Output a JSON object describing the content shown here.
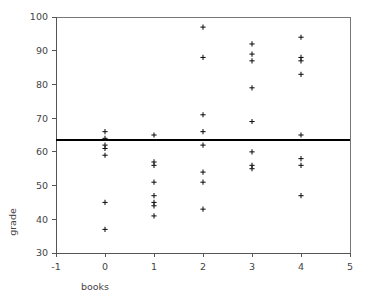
{
  "chart_data": {
    "type": "scatter",
    "title": "",
    "xlabel": "books",
    "ylabel": "grade",
    "xlim": [
      -1,
      5
    ],
    "ylim": [
      30,
      100
    ],
    "xticks": [
      -1,
      0,
      1,
      2,
      3,
      4,
      5
    ],
    "xtick_labels": [
      "-1",
      "0",
      "1",
      "2",
      "3",
      "4",
      "5"
    ],
    "yticks": [
      30,
      40,
      50,
      60,
      70,
      80,
      90,
      100
    ],
    "ytick_labels": [
      "30",
      "40",
      "50",
      "60",
      "70",
      "80",
      "90",
      "100"
    ],
    "grid": false,
    "legend": null,
    "marker": "plus",
    "marker_color": "#111111",
    "reference_line": {
      "orientation": "horizontal",
      "value": 63.5,
      "color": "#000000",
      "label": ""
    },
    "x": [
      0,
      0,
      0,
      0,
      0,
      0,
      0,
      1,
      1,
      1,
      1,
      1,
      1,
      1,
      2,
      2,
      2,
      2,
      2,
      2,
      2,
      2,
      2,
      3,
      3,
      3,
      3,
      3,
      3,
      3,
      3,
      3,
      4,
      4,
      4,
      4,
      4,
      4,
      4,
      4
    ],
    "y": [
      66,
      64,
      62,
      61,
      59,
      45,
      37,
      65,
      57,
      56,
      51,
      47,
      45,
      44,
      41,
      97,
      88,
      71,
      66,
      62,
      54,
      51,
      43,
      92,
      89,
      87,
      79,
      69,
      60,
      56,
      55,
      94,
      88,
      87,
      83,
      65,
      58,
      56,
      47
    ],
    "points": [
      {
        "x": 0,
        "y": 66
      },
      {
        "x": 0,
        "y": 64
      },
      {
        "x": 0,
        "y": 62
      },
      {
        "x": 0,
        "y": 61
      },
      {
        "x": 0,
        "y": 59
      },
      {
        "x": 0,
        "y": 45
      },
      {
        "x": 0,
        "y": 37
      },
      {
        "x": 1,
        "y": 65
      },
      {
        "x": 1,
        "y": 57
      },
      {
        "x": 1,
        "y": 56
      },
      {
        "x": 1,
        "y": 51
      },
      {
        "x": 1,
        "y": 47
      },
      {
        "x": 1,
        "y": 45
      },
      {
        "x": 1,
        "y": 44
      },
      {
        "x": 1,
        "y": 41
      },
      {
        "x": 2,
        "y": 97
      },
      {
        "x": 2,
        "y": 88
      },
      {
        "x": 2,
        "y": 71
      },
      {
        "x": 2,
        "y": 66
      },
      {
        "x": 2,
        "y": 62
      },
      {
        "x": 2,
        "y": 54
      },
      {
        "x": 2,
        "y": 51
      },
      {
        "x": 2,
        "y": 43
      },
      {
        "x": 3,
        "y": 92
      },
      {
        "x": 3,
        "y": 89
      },
      {
        "x": 3,
        "y": 87
      },
      {
        "x": 3,
        "y": 79
      },
      {
        "x": 3,
        "y": 69
      },
      {
        "x": 3,
        "y": 60
      },
      {
        "x": 3,
        "y": 56
      },
      {
        "x": 3,
        "y": 55
      },
      {
        "x": 4,
        "y": 94
      },
      {
        "x": 4,
        "y": 88
      },
      {
        "x": 4,
        "y": 87
      },
      {
        "x": 4,
        "y": 83
      },
      {
        "x": 4,
        "y": 65
      },
      {
        "x": 4,
        "y": 58
      },
      {
        "x": 4,
        "y": 56
      },
      {
        "x": 4,
        "y": 47
      }
    ]
  },
  "layout": {
    "plot_left": 56,
    "plot_right": 350,
    "plot_top": 17,
    "plot_bottom": 253,
    "ylabel_x": 16,
    "ylabel_y": 222,
    "xlabel_x": 95,
    "xlabel_y": 290
  }
}
